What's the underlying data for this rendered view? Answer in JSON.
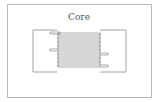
{
  "diagram": {
    "title": "Core",
    "type": "transformer-core-winding",
    "colors": {
      "stroke": "#8a8a8a",
      "frame": "#b8b8b8",
      "text": "#555555",
      "background": "#ffffff"
    },
    "winding_turns": 9
  }
}
